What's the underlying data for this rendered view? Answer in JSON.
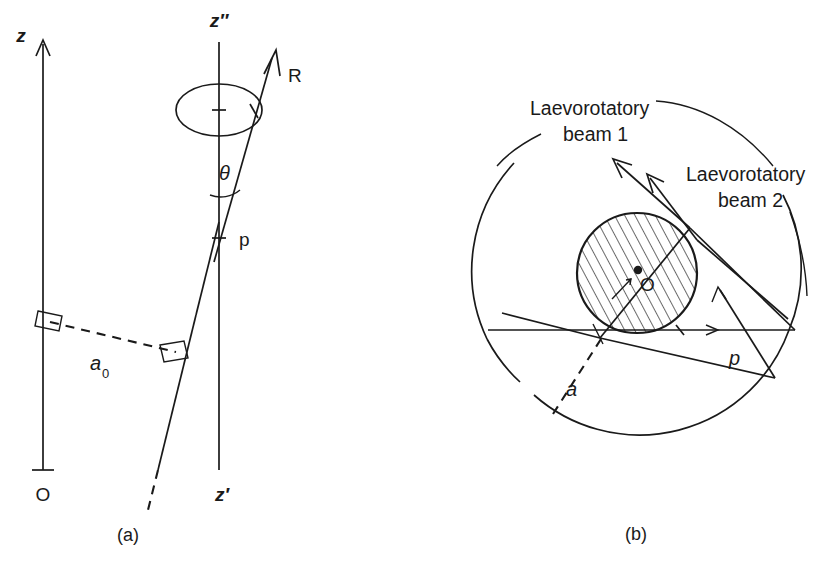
{
  "figure": {
    "background_color": "#ffffff",
    "ink_color": "#1a1a1a",
    "width": 835,
    "height": 563
  },
  "panel_a": {
    "caption": "(a)",
    "labels": {
      "z_axis": "z",
      "z_double_prime_axis": "z″",
      "z_prime_axis": "z′",
      "origin": "O",
      "point_p": "p",
      "vector_R": "R",
      "angle_theta": "θ",
      "impact_parameter": "a",
      "impact_parameter_subscript": "0"
    },
    "elements": {
      "z_axis_name": "vertical reference axis with up arrow",
      "z_double_prime_name": "tilted rotation axis through point p",
      "precession_ellipse_name": "precession cone circle",
      "right_angle_markers": 2,
      "dashed_segment_name": "perpendicular distance a0"
    }
  },
  "panel_b": {
    "caption": "(b)",
    "labels": {
      "beam_1": "Laevorotatory beam 1",
      "beam_1_line1": "Laevorotatory",
      "beam_1_line2": "beam 1",
      "beam_2": "Laevorotatory beam 2",
      "beam_2_line1": "Laevorotatory",
      "beam_2_line2": "beam 2",
      "centre": "O",
      "outer_radius": "p",
      "impact_parameter": "a"
    },
    "elements": {
      "outer_circle_name": "outer boundary circle",
      "inner_circle_name": "hatched scattering sphere",
      "hatching": "diagonal 45 degree lines",
      "incoming_rays": 2,
      "outgoing_rays": 4,
      "centre_dot": true
    }
  }
}
